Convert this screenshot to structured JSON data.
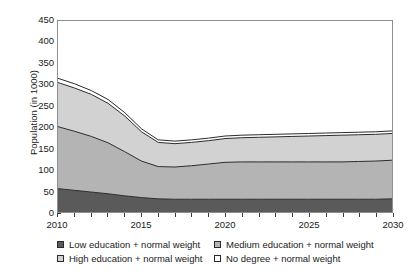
{
  "chart_data": {
    "type": "area",
    "stacked": true,
    "title": "",
    "xlabel": "",
    "ylabel": "Population (in 1000)",
    "xlim": [
      2010,
      2030
    ],
    "ylim": [
      0,
      450
    ],
    "y_ticks": [
      0,
      50,
      100,
      150,
      200,
      250,
      300,
      350,
      400,
      450
    ],
    "x_ticks": [
      2010,
      2011,
      2012,
      2013,
      2014,
      2015,
      2016,
      2017,
      2018,
      2019,
      2020,
      2021,
      2022,
      2023,
      2024,
      2025,
      2026,
      2027,
      2028,
      2029,
      2030
    ],
    "x_tick_labels": [
      "2010",
      "2015",
      "2020",
      "2025",
      "2030"
    ],
    "x_tick_label_values": [
      2010,
      2015,
      2020,
      2025,
      2030
    ],
    "grid": false,
    "legend_position": "bottom",
    "x": [
      2010,
      2011,
      2012,
      2013,
      2014,
      2015,
      2016,
      2017,
      2018,
      2019,
      2020,
      2021,
      2022,
      2023,
      2024,
      2025,
      2026,
      2027,
      2028,
      2029,
      2030
    ],
    "series": [
      {
        "name": "Low education + normal weight",
        "color": "#5a5a5a",
        "values": [
          55,
          51,
          47,
          43,
          38,
          34,
          31,
          30,
          30,
          30,
          30,
          30,
          30,
          30,
          30,
          30,
          30,
          30,
          30,
          30,
          31
        ]
      },
      {
        "name": "Medium education + normal weight",
        "color": "#b4b4b4",
        "values": [
          146,
          139,
          131,
          120,
          104,
          86,
          76,
          76,
          79,
          83,
          87,
          88,
          88,
          88,
          88,
          88,
          88,
          88,
          89,
          90,
          91
        ]
      },
      {
        "name": "High education + normal weight",
        "color": "#d2d2d2",
        "values": [
          104,
          102,
          99,
          93,
          84,
          69,
          57,
          55,
          55,
          55,
          56,
          57,
          58,
          59,
          60,
          61,
          62,
          63,
          63,
          63,
          63
        ]
      },
      {
        "name": "No degree + normal weight",
        "color": "#ffffff",
        "values": [
          10,
          10,
          9,
          9,
          8,
          7,
          6,
          6,
          6,
          6,
          6,
          6,
          6,
          6,
          6,
          6,
          6,
          6,
          6,
          6,
          6
        ]
      }
    ],
    "cumulative_tops": {
      "low": [
        55,
        51,
        47,
        43,
        38,
        34,
        31,
        30,
        30,
        30,
        30,
        30,
        30,
        30,
        30,
        30,
        30,
        30,
        30,
        30,
        31
      ],
      "low_medium": [
        201,
        190,
        178,
        163,
        142,
        120,
        107,
        106,
        109,
        113,
        117,
        118,
        118,
        118,
        118,
        118,
        118,
        118,
        119,
        120,
        122
      ],
      "low_medium_high": [
        305,
        292,
        277,
        256,
        226,
        189,
        164,
        161,
        164,
        168,
        173,
        175,
        176,
        177,
        178,
        179,
        180,
        181,
        182,
        183,
        185
      ],
      "total": [
        315,
        302,
        286,
        265,
        234,
        196,
        170,
        167,
        170,
        174,
        179,
        181,
        182,
        183,
        184,
        185,
        186,
        187,
        188,
        189,
        191
      ]
    },
    "legend_entries": [
      {
        "label": "Low education + normal weight",
        "color": "#5a5a5a",
        "position": "row1-col1"
      },
      {
        "label": "Medium education + normal weight",
        "color": "#b4b4b4",
        "position": "row1-col2"
      },
      {
        "label": "High education + normal weight",
        "color": "#d2d2d2",
        "position": "row2-col1"
      },
      {
        "label": "No degree + normal weight",
        "color": "#ffffff",
        "position": "row2-col2"
      }
    ]
  },
  "axis": {
    "y_title": "Population (in 1000)",
    "y_tick_labels": [
      "0",
      "50",
      "100",
      "150",
      "200",
      "250",
      "300",
      "350",
      "400",
      "450"
    ],
    "x_tick_labels": [
      "2010",
      "2015",
      "2020",
      "2025",
      "2030"
    ]
  },
  "colors": {
    "low": "#5a5a5a",
    "medium": "#b4b4b4",
    "high": "#d2d2d2",
    "nodegree": "#ffffff",
    "line": "#2b2b2b",
    "frame": "#8e8e8e",
    "text": "#1a1a1a"
  }
}
